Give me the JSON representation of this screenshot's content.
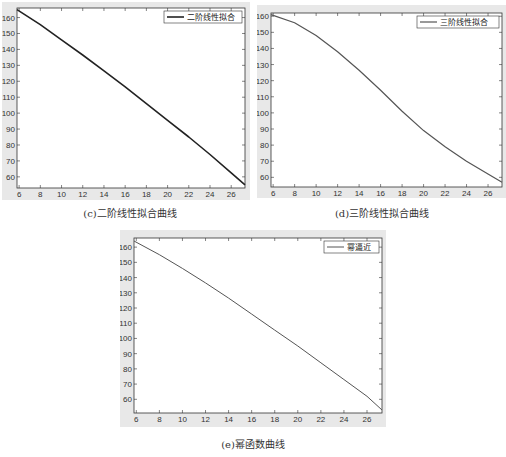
{
  "chart_data": [
    {
      "id": "c",
      "type": "line",
      "title": "",
      "caption": "(c)二阶线性拟合曲线",
      "legend": [
        "二阶线性拟合"
      ],
      "legend_position": "top-right",
      "xlabel": "",
      "ylabel": "",
      "xlim": [
        5.8,
        27.3
      ],
      "ylim": [
        53,
        166
      ],
      "xticks": [
        6,
        8,
        10,
        12,
        14,
        16,
        18,
        20,
        22,
        24,
        26
      ],
      "yticks": [
        60,
        70,
        80,
        90,
        100,
        110,
        120,
        130,
        140,
        150,
        160
      ],
      "grid": false,
      "series": [
        {
          "name": "二阶线性拟合",
          "color": "#222222",
          "width": 1.6,
          "x": [
            5.8,
            8,
            10,
            12,
            14,
            16,
            18,
            20,
            22,
            24,
            26,
            27.3
          ],
          "y": [
            165,
            155.5,
            146,
            136.5,
            126.5,
            116.5,
            106,
            95.5,
            85,
            74,
            62.5,
            55
          ]
        }
      ]
    },
    {
      "id": "d",
      "type": "line",
      "title": "",
      "caption": "(d)三阶线性拟合曲线",
      "legend": [
        "三阶线性拟合"
      ],
      "legend_position": "top-right",
      "xlabel": "",
      "ylabel": "",
      "xlim": [
        5.8,
        27.3
      ],
      "ylim": [
        54,
        162
      ],
      "xticks": [
        6,
        8,
        10,
        12,
        14,
        16,
        18,
        20,
        22,
        24,
        26
      ],
      "yticks": [
        60,
        70,
        80,
        90,
        100,
        110,
        120,
        130,
        140,
        150,
        160
      ],
      "grid": false,
      "series": [
        {
          "name": "三阶线性拟合",
          "color": "#555555",
          "width": 1.2,
          "x": [
            5.8,
            8,
            10,
            12,
            14,
            16,
            18,
            20,
            22,
            24,
            26,
            27.3
          ],
          "y": [
            161,
            156,
            148,
            138,
            126.5,
            114,
            101,
            89,
            79,
            70,
            62,
            57
          ]
        }
      ]
    },
    {
      "id": "e",
      "type": "line",
      "title": "",
      "caption": "(e)幂函数曲线",
      "legend": [
        "幂逼近"
      ],
      "legend_position": "top-right",
      "xlabel": "",
      "ylabel": "",
      "xlim": [
        5.8,
        27.3
      ],
      "ylim": [
        51,
        166
      ],
      "xticks": [
        6,
        8,
        10,
        12,
        14,
        16,
        18,
        20,
        22,
        24,
        26
      ],
      "yticks": [
        60,
        70,
        80,
        90,
        100,
        110,
        120,
        130,
        140,
        150,
        160
      ],
      "grid": false,
      "series": [
        {
          "name": "幂逼近",
          "color": "#555555",
          "width": 1.0,
          "x": [
            5.8,
            8,
            10,
            12,
            14,
            16,
            18,
            20,
            22,
            24,
            26,
            27.3
          ],
          "y": [
            164,
            155,
            146,
            136.5,
            126.5,
            116,
            105.5,
            95,
            84,
            73,
            62,
            53
          ]
        }
      ]
    }
  ],
  "figures": {
    "c": {
      "caption": "(c)二阶线性拟合曲线",
      "legend": "二阶线性拟合"
    },
    "d": {
      "caption": "(d)三阶线性拟合曲线",
      "legend": "三阶线性拟合"
    },
    "e": {
      "caption": "(e)幂函数曲线",
      "legend": "幂逼近"
    }
  }
}
